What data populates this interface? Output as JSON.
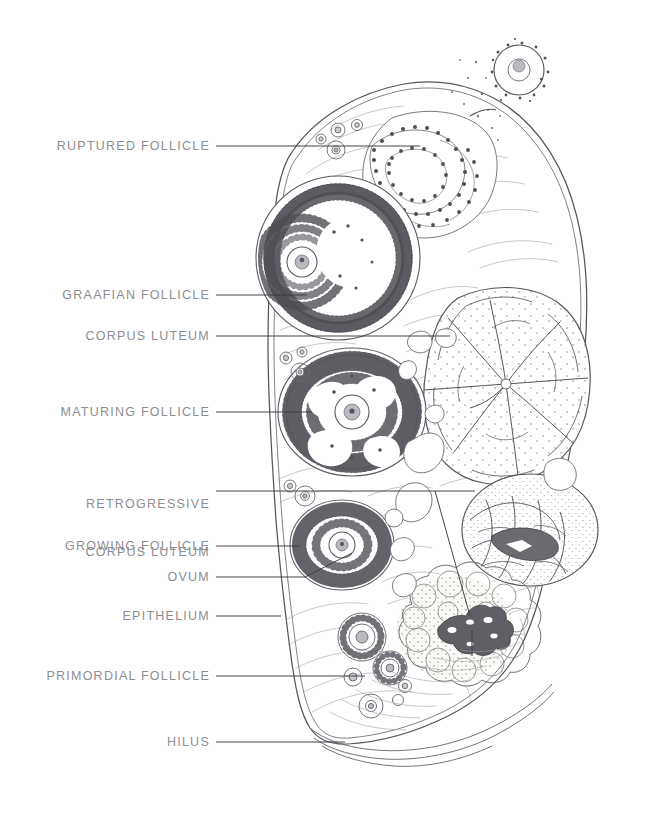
{
  "figure": {
    "background_color": "#ffffff",
    "ink_color": "#55555c",
    "label_color": "#8d8d93",
    "leader_color": "#3a3a40"
  },
  "labels": [
    {
      "id": "ruptured-follicle",
      "text": "RUPTURED FOLLICLE",
      "lines": [
        "RUPTURED FOLLICLE"
      ],
      "text_right": 210,
      "text_y": 146,
      "leader": [
        [
          216,
          146
        ],
        [
          420,
          146
        ]
      ]
    },
    {
      "id": "graafian-follicle",
      "text": "GRAAFIAN FOLLICLE",
      "lines": [
        "GRAAFIAN FOLLICLE"
      ],
      "text_right": 210,
      "text_y": 295,
      "leader": [
        [
          216,
          295
        ],
        [
          307,
          295
        ]
      ]
    },
    {
      "id": "corpus-luteum",
      "text": "CORPUS LUTEUM",
      "lines": [
        "CORPUS LUTEUM"
      ],
      "text_right": 210,
      "text_y": 336,
      "leader": [
        [
          216,
          336
        ],
        [
          450,
          336
        ]
      ]
    },
    {
      "id": "maturing-follicle",
      "text": "MATURING FOLLICLE",
      "lines": [
        "MATURING FOLLICLE"
      ],
      "text_right": 210,
      "text_y": 412,
      "leader": [
        [
          216,
          412
        ],
        [
          312,
          412
        ]
      ]
    },
    {
      "id": "retrogressive-corpus-luteum",
      "text": "RETROGRESSIVE CORPUS LUTEUM",
      "lines": [
        "RETROGRESSIVE",
        "CORPUS LUTEUM"
      ],
      "text_right": 210,
      "text_y": 482,
      "leader": [
        [
          216,
          491
        ],
        [
          475,
          491
        ]
      ]
    },
    {
      "id": "growing-follicle",
      "text": "GROWING FOLLICLE",
      "lines": [
        "GROWING FOLLICLE"
      ],
      "text_right": 210,
      "text_y": 546,
      "leader": [
        [
          216,
          546
        ],
        [
          300,
          546
        ]
      ]
    },
    {
      "id": "ovum",
      "text": "OVUM",
      "lines": [
        "OVUM"
      ],
      "text_right": 210,
      "text_y": 577,
      "leader": [
        [
          216,
          577
        ],
        [
          305,
          577
        ]
      ]
    },
    {
      "id": "epithelium",
      "text": "EPITHELIUM",
      "lines": [
        "EPITHELIUM"
      ],
      "text_right": 210,
      "text_y": 616,
      "leader": [
        [
          216,
          616
        ],
        [
          280,
          616
        ]
      ]
    },
    {
      "id": "primordial-follicle",
      "text": "PRIMORDIAL FOLLICLE",
      "lines": [
        "PRIMORDIAL FOLLICLE"
      ],
      "text_right": 210,
      "text_y": 676,
      "leader": [
        [
          216,
          676
        ],
        [
          365,
          676
        ]
      ]
    },
    {
      "id": "hilus",
      "text": "HILUS",
      "lines": [
        "HILUS"
      ],
      "text_right": 210,
      "text_y": 742,
      "leader": [
        [
          216,
          742
        ],
        [
          345,
          742
        ]
      ]
    }
  ],
  "structures": [
    {
      "id": "ovary-outline",
      "name": "ovary cortex outline"
    },
    {
      "id": "germinal-epithelium",
      "name": "germinal epithelium (outer double line)"
    },
    {
      "id": "ruptured-follicle-body",
      "name": "ruptured follicle with collapsed granulosa"
    },
    {
      "id": "discharged-ovum",
      "name": "discharged ovum above ovary surface"
    },
    {
      "id": "graafian-follicle-body",
      "name": "graafian follicle with antrum and cumulus oophorus"
    },
    {
      "id": "corpus-luteum-body",
      "name": "corpus luteum with folded luteal cords"
    },
    {
      "id": "maturing-follicle-body",
      "name": "maturing follicle with forming antrum"
    },
    {
      "id": "retrogressive-corpus-luteum-body",
      "name": "retrogressive corpus luteum"
    },
    {
      "id": "corpus-albicans-body",
      "name": "corpus albicans with hyaline scar"
    },
    {
      "id": "growing-follicle-body",
      "name": "growing follicle"
    },
    {
      "id": "primordial-follicles",
      "name": "primordial follicles near cortex"
    },
    {
      "id": "hilus-region",
      "name": "hilus with vessels entering"
    },
    {
      "id": "stroma",
      "name": "ovarian stroma fibres"
    }
  ]
}
